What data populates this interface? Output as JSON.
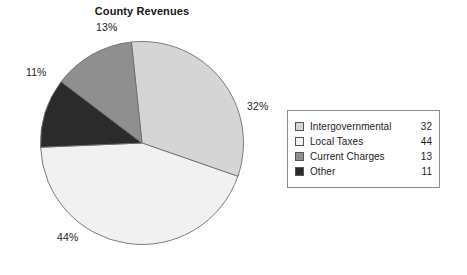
{
  "chart_data": {
    "type": "pie",
    "title": "County Revenues",
    "xlabel": "",
    "ylabel": "",
    "categories": [
      "Intergovernmental",
      "Local Taxes",
      "Current Charges",
      "Other"
    ],
    "values": [
      32,
      44,
      13,
      11
    ],
    "slice_labels": [
      "32%",
      "44%",
      "13%",
      "11%"
    ],
    "slice_colors": [
      "#d5d5d5",
      "#f1f1f1",
      "#8f8f8f",
      "#2b2b2b"
    ],
    "legend_position": "right",
    "grid": false,
    "slices": [
      {
        "name": "Intergovernmental",
        "value": 32,
        "percent_label": "32%",
        "color": "#d5d5d5",
        "start_angle": 0,
        "end_angle": 115.2
      },
      {
        "name": "Local Taxes",
        "value": 44,
        "percent_label": "44%",
        "color": "#f1f1f1",
        "start_angle": 115.2,
        "end_angle": 273.6
      },
      {
        "name": "Other",
        "value": 11,
        "percent_label": "11%",
        "color": "#2b2b2b",
        "start_angle": 273.6,
        "end_angle": 313.2
      },
      {
        "name": "Current Charges",
        "value": 13,
        "percent_label": "13%",
        "color": "#8f8f8f",
        "start_angle": 313.2,
        "end_angle": 360
      }
    ]
  },
  "title": "County Revenues",
  "percent_callouts": {
    "top": "13%",
    "left": "11%",
    "right": "32%",
    "bottom": "44%"
  },
  "legend": {
    "rows": [
      {
        "label": "Intergovernmental",
        "value": "32",
        "color": "#d5d5d5"
      },
      {
        "label": "Local Taxes",
        "value": "44",
        "color": "#f1f1f1"
      },
      {
        "label": "Current Charges",
        "value": "13",
        "color": "#8f8f8f"
      },
      {
        "label": "Other",
        "value": "11",
        "color": "#2b2b2b"
      }
    ]
  },
  "style": {
    "slice_stroke": "#6e6e6e",
    "legend_border": "#8c8c8c",
    "text_color": "#1d1d1d",
    "background": "#ffffff"
  }
}
